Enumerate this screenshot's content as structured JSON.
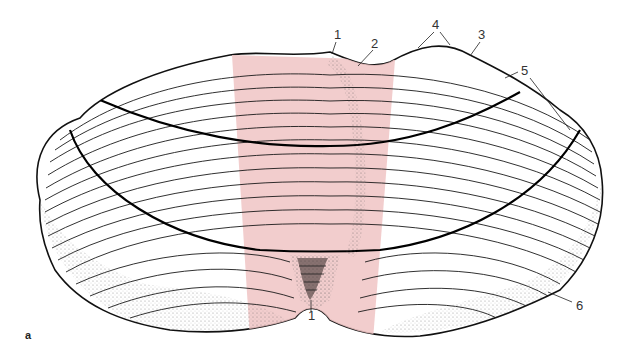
{
  "figure": {
    "panel_letter": "a",
    "highlight_color": "#f0c4c4",
    "labels": [
      {
        "id": "label-1-top",
        "text": "1",
        "x": 334,
        "y": 28
      },
      {
        "id": "label-2",
        "text": "2",
        "x": 371,
        "y": 37
      },
      {
        "id": "label-4",
        "text": "4",
        "x": 432,
        "y": 18
      },
      {
        "id": "label-3",
        "text": "3",
        "x": 478,
        "y": 28
      },
      {
        "id": "label-5",
        "text": "5",
        "x": 521,
        "y": 64
      },
      {
        "id": "label-6",
        "text": "6",
        "x": 576,
        "y": 299
      },
      {
        "id": "label-1-bottom",
        "text": "1",
        "x": 308,
        "y": 309
      }
    ]
  }
}
